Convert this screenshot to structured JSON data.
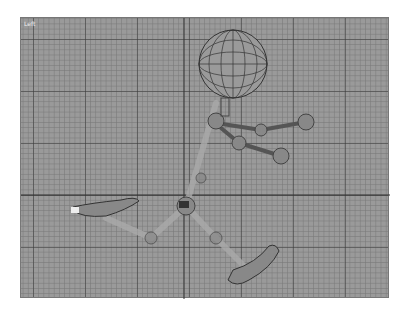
{
  "viewport": {
    "label": "Left",
    "axis_x": 163,
    "axis_y": 177
  },
  "scene": {
    "description": "wireframe stick figure character in side view",
    "colors": {
      "grid_bg": "#9a9a9a",
      "wire": "#3a3a3a",
      "bone": "#b0b0b0"
    }
  }
}
